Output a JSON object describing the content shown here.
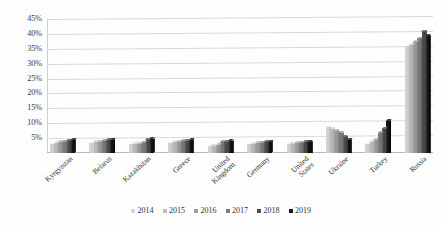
{
  "chart_data": {
    "type": "bar",
    "title": "",
    "subtitle": "",
    "xlabel": "",
    "ylabel": "",
    "ylim": [
      0,
      45
    ],
    "ytick_labels": [
      "45%",
      "40%",
      "35%",
      "30%",
      "25%",
      "20%",
      "15%",
      "10%",
      "5%"
    ],
    "ytick_values": [
      45,
      40,
      35,
      30,
      25,
      20,
      15,
      10,
      5
    ],
    "grid": true,
    "legend_position": "bottom",
    "categories": [
      "Kyrgyzstan",
      "Belarus",
      "Kazakhstan",
      "Greece",
      "United\nKingdom",
      "Germany",
      "United\nStates",
      "Ukraine",
      "Turkey",
      "Russia"
    ],
    "series": [
      {
        "name": "2014",
        "color": "#d6d6d6",
        "values": [
          3.4,
          3.6,
          3.1,
          3.6,
          2.6,
          3.2,
          3.3,
          9.0,
          3.4,
          36.0
        ]
      },
      {
        "name": "2015",
        "color": "#bdbdbd",
        "values": [
          3.6,
          3.8,
          3.2,
          3.8,
          2.7,
          3.4,
          3.4,
          8.3,
          4.0,
          36.5
        ]
      },
      {
        "name": "2016",
        "color": "#9e9e9e",
        "values": [
          3.8,
          4.0,
          3.4,
          4.0,
          2.9,
          3.5,
          3.5,
          7.6,
          4.6,
          37.5
        ]
      },
      {
        "name": "2017",
        "color": "#7d7d7d",
        "values": [
          4.0,
          4.2,
          3.6,
          4.2,
          3.8,
          3.7,
          3.6,
          6.8,
          6.8,
          38.5
        ]
      },
      {
        "name": "2018",
        "color": "#4f4f4f",
        "values": [
          4.3,
          4.5,
          4.6,
          4.4,
          4.0,
          3.9,
          3.8,
          5.6,
          8.4,
          41.0
        ]
      },
      {
        "name": "2019",
        "color": "#1a1a1a",
        "values": [
          4.5,
          4.7,
          4.8,
          4.6,
          4.2,
          4.0,
          3.9,
          4.6,
          10.8,
          39.5
        ]
      }
    ]
  }
}
